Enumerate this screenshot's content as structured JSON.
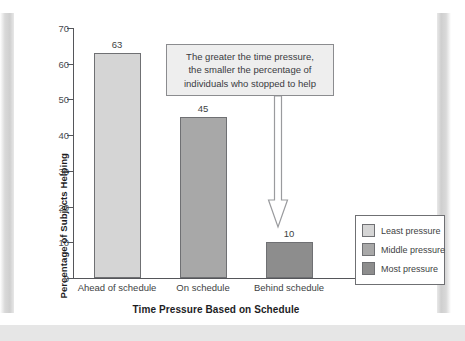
{
  "chart_data": {
    "type": "bar",
    "title": "",
    "subtitle": "",
    "categories": [
      "Ahead of schedule",
      "On schedule",
      "Behind schedule"
    ],
    "values": [
      63,
      45,
      10
    ],
    "value_labels": [
      "63",
      "45",
      "10"
    ],
    "xlabel": "Time Pressure Based on Schedule",
    "ylabel": "Percentage of Subjects Helping",
    "ylim": [
      0,
      70
    ],
    "ytick_values": [
      0,
      10,
      20,
      30,
      40,
      50,
      60,
      70
    ],
    "ytick_labels": [
      "0",
      "10",
      "20",
      "30",
      "40",
      "50",
      "60",
      "70"
    ],
    "grid": false,
    "legend_position": "bottom-right",
    "legend": [
      {
        "label": "Least pressure",
        "color": "#d5d5d5"
      },
      {
        "label": "Middle pressure",
        "color": "#a8a8a8"
      },
      {
        "label": "Most pressure",
        "color": "#8d8d8d"
      }
    ],
    "bar_colors": [
      "#d5d5d5",
      "#a8a8a8",
      "#8d8d8d"
    ],
    "annotation": {
      "text": "The greater the time pressure,\nthe smaller the percentage of\nindividuals who stopped to help",
      "points_to_category": "Behind schedule",
      "arrow": "down-arrow"
    },
    "axis_color": "#55565a",
    "text_color": "#3e3f43"
  }
}
